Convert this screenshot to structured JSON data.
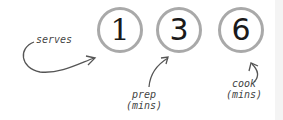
{
  "stats": [
    {
      "value": "1",
      "label": "serves"
    },
    {
      "value": "3",
      "label_line1": "prep",
      "label_line2": "(mins)"
    },
    {
      "value": "6",
      "label_line1": "cook",
      "label_line2": "(mins)"
    }
  ],
  "colors": {
    "circle_border": "#a9a9a9",
    "number": "#1a1a1a",
    "annotation": "#444444"
  }
}
